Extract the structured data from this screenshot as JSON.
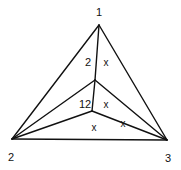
{
  "diagram": {
    "type": "triangulated-triangle",
    "stroke_color": "#111111",
    "background": "#ffffff",
    "vertices": [
      {
        "id": "v1",
        "label": "1",
        "x": 99,
        "y": 25,
        "lx": 99,
        "ly": 16
      },
      {
        "id": "v2",
        "label": "2",
        "x": 12,
        "y": 139,
        "lx": 11,
        "ly": 161
      },
      {
        "id": "v3",
        "label": "3",
        "x": 167,
        "y": 140,
        "lx": 168,
        "ly": 162
      }
    ],
    "inner_points": [
      {
        "id": "p",
        "x": 95,
        "y": 80
      },
      {
        "id": "q",
        "x": 92,
        "y": 111
      }
    ],
    "edge_labels": [
      {
        "text": "2",
        "x": 88,
        "y": 66
      },
      {
        "text": "12",
        "x": 85,
        "y": 108
      }
    ],
    "marks": [
      {
        "text": "x",
        "x": 106,
        "y": 66
      },
      {
        "text": "x",
        "x": 106,
        "y": 108
      },
      {
        "text": "x",
        "x": 94,
        "y": 131
      },
      {
        "text": "x",
        "x": 123,
        "y": 127
      }
    ]
  }
}
